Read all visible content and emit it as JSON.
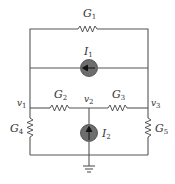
{
  "diagram": {
    "type": "circuit-schematic",
    "components": {
      "G1": {
        "label_main": "G",
        "label_sub": "1",
        "kind": "conductance",
        "between": [
          "v1",
          "v3"
        ],
        "path": "top branch"
      },
      "I1": {
        "label_main": "I",
        "label_sub": "1",
        "kind": "current-source",
        "between": [
          "v1",
          "v3"
        ],
        "direction": "left"
      },
      "G2": {
        "label_main": "G",
        "label_sub": "2",
        "kind": "conductance",
        "between": [
          "v1",
          "v2"
        ]
      },
      "G3": {
        "label_main": "G",
        "label_sub": "3",
        "kind": "conductance",
        "between": [
          "v2",
          "v3"
        ]
      },
      "G4": {
        "label_main": "G",
        "label_sub": "4",
        "kind": "conductance",
        "between": [
          "v1",
          "ground"
        ]
      },
      "G5": {
        "label_main": "G",
        "label_sub": "5",
        "kind": "conductance",
        "between": [
          "v3",
          "ground"
        ]
      },
      "I2": {
        "label_main": "I",
        "label_sub": "2",
        "kind": "current-source",
        "between": [
          "ground",
          "v2"
        ],
        "direction": "up"
      }
    },
    "nodes": {
      "v1": {
        "label_main": "v",
        "label_sub": "1"
      },
      "v2": {
        "label_main": "v",
        "label_sub": "2"
      },
      "v3": {
        "label_main": "v",
        "label_sub": "3"
      }
    },
    "ground": {
      "label": "ground"
    },
    "colors": {
      "wire": "#555555",
      "source_fill": "#6d6d6d",
      "arrow": "#111111",
      "text": "#333333"
    }
  }
}
